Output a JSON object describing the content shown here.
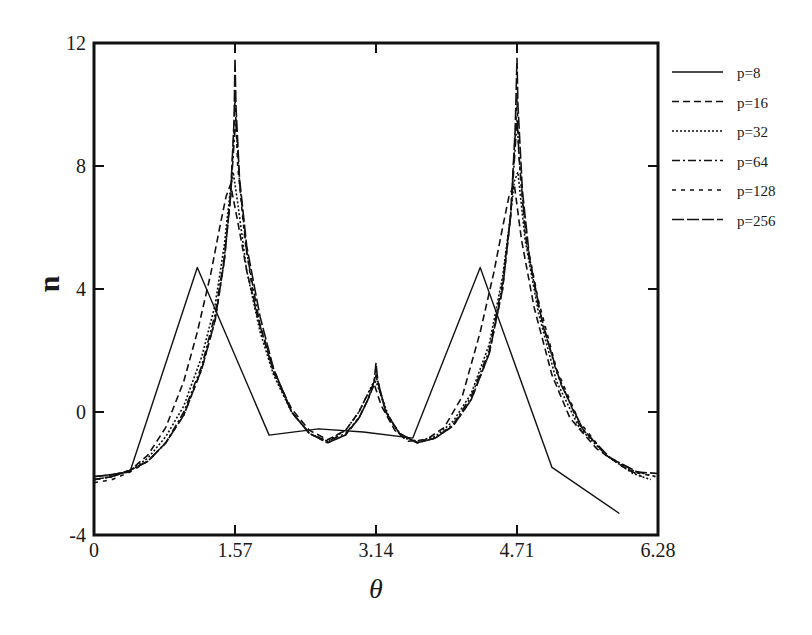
{
  "chart_data": {
    "type": "line",
    "title": "",
    "xlabel": "θ",
    "ylabel": "u",
    "xlim": [
      0,
      6.28
    ],
    "ylim": [
      -4,
      12
    ],
    "xticks": [
      0,
      1.57,
      3.14,
      4.71,
      6.28
    ],
    "xtick_labels": [
      "0",
      "1.57",
      "3.14",
      "4.71",
      "6.28"
    ],
    "yticks": [
      -4,
      0,
      4,
      8,
      12
    ],
    "ytick_labels": [
      "-4",
      "0",
      "4",
      "8",
      "12"
    ],
    "grid": false,
    "legend_position": "outside-right-top",
    "series": [
      {
        "name": "p=8",
        "dash": "",
        "x": [
          0.0,
          0.15,
          0.4,
          1.15,
          1.95,
          2.5,
          3.0,
          3.55,
          4.3,
          5.1,
          5.85
        ],
        "y": [
          -2.1,
          -2.05,
          -1.95,
          4.7,
          -0.75,
          -0.55,
          -0.65,
          -0.85,
          4.7,
          -1.8,
          -3.3
        ]
      },
      {
        "name": "p=16",
        "dash": "7,4",
        "x": [
          0.0,
          0.2,
          0.4,
          0.6,
          0.8,
          1.0,
          1.15,
          1.3,
          1.4,
          1.47,
          1.52,
          1.6,
          1.7,
          1.85,
          2.0,
          2.2,
          2.4,
          2.6,
          2.8,
          2.95,
          3.05,
          3.12,
          3.2,
          3.35,
          3.5,
          3.7,
          3.9,
          4.1,
          4.3,
          4.45,
          4.55,
          4.62,
          4.68,
          4.76,
          4.9,
          5.1,
          5.3,
          5.6,
          5.9,
          6.1
        ],
        "y": [
          -2.2,
          -2.1,
          -1.9,
          -1.4,
          -0.5,
          1.0,
          2.6,
          4.5,
          6.0,
          7.0,
          7.4,
          6.2,
          4.6,
          2.8,
          1.3,
          0.1,
          -0.6,
          -0.9,
          -0.6,
          0.0,
          0.6,
          0.9,
          0.2,
          -0.6,
          -0.95,
          -0.9,
          -0.5,
          0.5,
          2.6,
          4.5,
          6.0,
          7.0,
          7.4,
          5.6,
          3.4,
          1.2,
          -0.2,
          -1.2,
          -1.8,
          -2.1
        ]
      },
      {
        "name": "p=32",
        "dash": "2,2",
        "x": [
          0.0,
          0.2,
          0.4,
          0.6,
          0.8,
          1.0,
          1.2,
          1.35,
          1.45,
          1.51,
          1.55,
          1.6,
          1.7,
          1.85,
          2.0,
          2.2,
          2.4,
          2.6,
          2.8,
          2.95,
          3.05,
          3.1,
          3.14,
          3.2,
          3.3,
          3.45,
          3.6,
          3.8,
          4.0,
          4.2,
          4.4,
          4.55,
          4.63,
          4.68,
          4.72,
          4.8,
          4.95,
          5.15,
          5.4,
          5.7,
          6.0,
          6.2
        ],
        "y": [
          -2.2,
          -2.1,
          -1.9,
          -1.5,
          -0.8,
          0.2,
          1.8,
          3.5,
          5.4,
          7.0,
          7.8,
          6.8,
          4.6,
          2.6,
          1.2,
          0.0,
          -0.7,
          -0.95,
          -0.6,
          0.0,
          0.6,
          0.9,
          1.0,
          0.5,
          -0.3,
          -0.85,
          -0.95,
          -0.8,
          -0.3,
          0.6,
          2.2,
          4.4,
          6.2,
          7.5,
          7.8,
          5.6,
          3.2,
          1.0,
          -0.5,
          -1.4,
          -2.0,
          -2.2
        ]
      },
      {
        "name": "p=64",
        "dash": "8,3,2,3",
        "x": [
          0.0,
          0.2,
          0.4,
          0.6,
          0.8,
          1.0,
          1.2,
          1.35,
          1.45,
          1.52,
          1.56,
          1.58,
          1.62,
          1.7,
          1.85,
          2.0,
          2.2,
          2.4,
          2.6,
          2.8,
          2.95,
          3.05,
          3.12,
          3.14,
          3.17,
          3.25,
          3.4,
          3.6,
          3.8,
          4.0,
          4.2,
          4.4,
          4.55,
          4.64,
          4.69,
          4.71,
          4.74,
          4.82,
          4.95,
          5.15,
          5.4,
          5.7,
          6.0,
          6.25
        ],
        "y": [
          -2.2,
          -2.1,
          -1.9,
          -1.6,
          -1.0,
          0.0,
          1.5,
          3.2,
          5.0,
          7.0,
          8.8,
          9.5,
          7.5,
          5.2,
          2.8,
          1.3,
          0.0,
          -0.7,
          -0.95,
          -0.7,
          -0.2,
          0.4,
          0.9,
          1.2,
          0.8,
          0.0,
          -0.7,
          -1.0,
          -0.85,
          -0.4,
          0.5,
          2.0,
          4.2,
          6.4,
          8.6,
          9.5,
          8.0,
          5.4,
          3.4,
          1.3,
          -0.4,
          -1.4,
          -1.9,
          -2.1
        ]
      },
      {
        "name": "p=128",
        "dash": "4,5",
        "x": [
          0.0,
          0.2,
          0.4,
          0.6,
          0.8,
          1.0,
          1.2,
          1.35,
          1.45,
          1.52,
          1.56,
          1.57,
          1.6,
          1.68,
          1.8,
          2.0,
          2.2,
          2.4,
          2.6,
          2.8,
          2.95,
          3.05,
          3.12,
          3.14,
          3.17,
          3.25,
          3.4,
          3.6,
          3.8,
          4.0,
          4.2,
          4.4,
          4.55,
          4.64,
          4.69,
          4.71,
          4.73,
          4.8,
          4.95,
          5.15,
          5.4,
          5.7,
          6.0,
          6.25
        ],
        "y": [
          -2.3,
          -2.2,
          -1.95,
          -1.6,
          -1.0,
          -0.1,
          1.4,
          3.0,
          4.9,
          7.0,
          9.2,
          10.2,
          8.0,
          5.6,
          3.3,
          1.4,
          0.0,
          -0.7,
          -1.0,
          -0.75,
          -0.2,
          0.4,
          1.0,
          1.4,
          0.9,
          0.0,
          -0.7,
          -1.0,
          -0.85,
          -0.45,
          0.4,
          1.9,
          4.0,
          6.4,
          9.0,
          10.2,
          8.4,
          5.8,
          3.6,
          1.4,
          -0.3,
          -1.4,
          -1.95,
          -2.1
        ]
      },
      {
        "name": "p=256",
        "dash": "12,3",
        "x": [
          0.0,
          0.2,
          0.4,
          0.6,
          0.8,
          1.0,
          1.2,
          1.35,
          1.45,
          1.52,
          1.56,
          1.57,
          1.58,
          1.62,
          1.7,
          1.85,
          2.0,
          2.2,
          2.4,
          2.6,
          2.8,
          2.95,
          3.05,
          3.12,
          3.14,
          3.16,
          3.25,
          3.4,
          3.6,
          3.8,
          4.0,
          4.2,
          4.4,
          4.55,
          4.64,
          4.69,
          4.71,
          4.72,
          4.77,
          4.85,
          5.0,
          5.2,
          5.45,
          5.75,
          6.05,
          6.28
        ],
        "y": [
          -2.1,
          -2.05,
          -1.9,
          -1.6,
          -1.0,
          -0.1,
          1.4,
          3.0,
          4.9,
          7.0,
          9.5,
          11.5,
          10.0,
          7.6,
          5.4,
          3.1,
          1.4,
          0.0,
          -0.7,
          -1.0,
          -0.75,
          -0.2,
          0.4,
          1.0,
          1.6,
          1.0,
          0.0,
          -0.7,
          -1.0,
          -0.85,
          -0.45,
          0.4,
          1.9,
          4.0,
          6.4,
          9.2,
          11.5,
          10.0,
          7.2,
          5.0,
          2.8,
          0.9,
          -0.6,
          -1.5,
          -1.95,
          -2.0
        ]
      }
    ]
  },
  "legend": {
    "items": [
      {
        "label": "p=8"
      },
      {
        "label": "p=16"
      },
      {
        "label": "p=32"
      },
      {
        "label": "p=64"
      },
      {
        "label": "p=128"
      },
      {
        "label": "p=256"
      }
    ]
  },
  "axes": {
    "x_title": "θ",
    "y_title": "u"
  }
}
